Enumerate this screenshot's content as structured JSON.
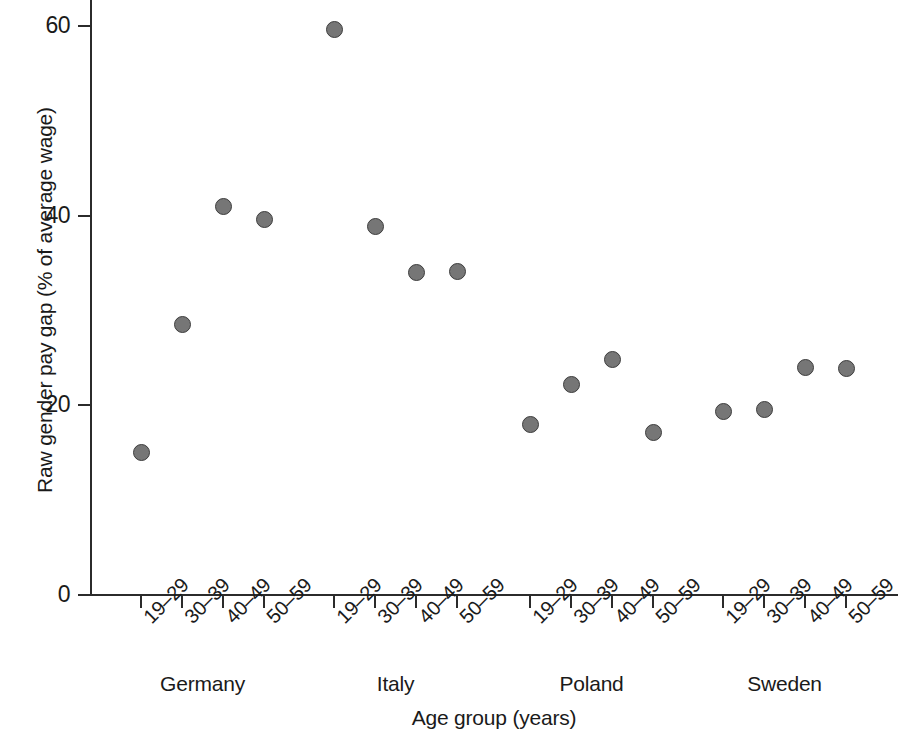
{
  "chart_data": {
    "type": "scatter",
    "title": "",
    "xlabel": "Age group (years)",
    "ylabel": "Raw gender pay gap (% of average wage)",
    "ylim": [
      0,
      62
    ],
    "yticks": [
      0,
      20,
      40,
      60
    ],
    "ytick_labels": [
      "0",
      "20",
      "40",
      "60"
    ],
    "grid": false,
    "legend": "none",
    "marker": {
      "shape": "circle",
      "fill_color": "#767676",
      "edge_color": "#3d3d3d",
      "size_px": 17
    },
    "categories": [
      "19–29",
      "30–39",
      "40–49",
      "50–59"
    ],
    "groups": [
      "Germany",
      "Italy",
      "Poland",
      "Sweden"
    ],
    "points": [
      {
        "group": "Germany",
        "category": "19–29",
        "value": 15.0
      },
      {
        "group": "Germany",
        "category": "30–39",
        "value": 28.5
      },
      {
        "group": "Germany",
        "category": "40–49",
        "value": 41.0
      },
      {
        "group": "Germany",
        "category": "50–59",
        "value": 39.6
      },
      {
        "group": "Italy",
        "category": "19–29",
        "value": 59.6
      },
      {
        "group": "Italy",
        "category": "30–39",
        "value": 38.9
      },
      {
        "group": "Italy",
        "category": "40–49",
        "value": 34.0
      },
      {
        "group": "Italy",
        "category": "50–59",
        "value": 34.1
      },
      {
        "group": "Poland",
        "category": "19–29",
        "value": 18.0
      },
      {
        "group": "Poland",
        "category": "30–39",
        "value": 22.2
      },
      {
        "group": "Poland",
        "category": "40–49",
        "value": 24.8
      },
      {
        "group": "Poland",
        "category": "50–59",
        "value": 17.1
      },
      {
        "group": "Sweden",
        "category": "19–29",
        "value": 19.4
      },
      {
        "group": "Sweden",
        "category": "30–39",
        "value": 19.6
      },
      {
        "group": "Sweden",
        "category": "40–49",
        "value": 24.0
      },
      {
        "group": "Sweden",
        "category": "50–59",
        "value": 23.9
      }
    ]
  },
  "axis": {
    "y_label_text": "Raw gender pay gap (% of average wage)",
    "x_label_text": "Age group (years)"
  }
}
